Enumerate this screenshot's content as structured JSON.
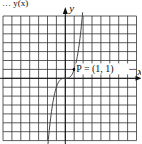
{
  "chart_data": {
    "type": "line",
    "title": "y(x)",
    "xlabel": "x",
    "ylabel": "y",
    "grid": true,
    "xlim": [
      -7,
      8
    ],
    "ylim": [
      -7,
      7
    ],
    "annotation": {
      "label": "P = (1, 1)",
      "x": 1,
      "y": 1
    },
    "series": [
      {
        "name": "y = x^3",
        "function": "x^3"
      }
    ]
  }
}
